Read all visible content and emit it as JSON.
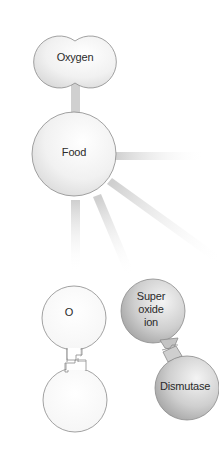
{
  "diagram": {
    "nodes": {
      "oxygen": {
        "label": "Oxygen"
      },
      "food": {
        "label": "Food"
      },
      "o_atom": {
        "label": "O"
      },
      "o_atom_pair": {
        "label": ""
      },
      "superoxide": {
        "line1": "Super",
        "line2": "oxide",
        "line3": "ion"
      },
      "dismutase": {
        "label": "Dismutase"
      }
    },
    "colors": {
      "background": "#ffffff",
      "light_node_fill": "#f2f2f2",
      "dark_node_fill": "#c9c9c9",
      "outline": "#8a8a8a",
      "connector": "#d2d2d2"
    }
  }
}
